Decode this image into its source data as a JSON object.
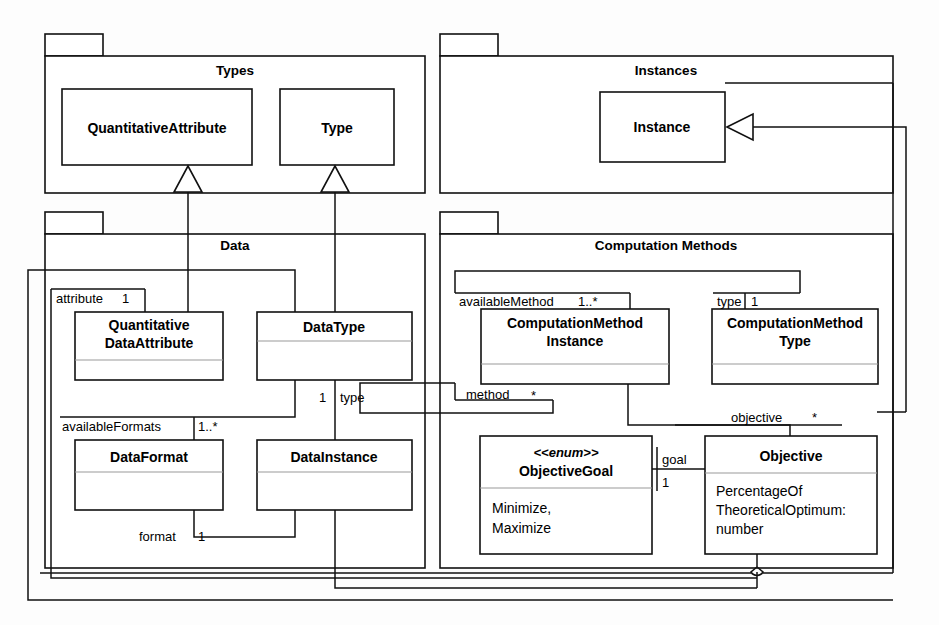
{
  "diagram": {
    "kind": "uml-class-diagram",
    "title": "",
    "line_color": "#111111",
    "fill_color": "#ffffff",
    "divider_color": "#9a9a9a"
  },
  "packages": [
    {
      "id": "types",
      "name": "Types"
    },
    {
      "id": "instances",
      "name": "Instances"
    },
    {
      "id": "data",
      "name": "Data"
    },
    {
      "id": "methods",
      "name": "Computation Methods"
    }
  ],
  "classes": [
    {
      "id": "quantitativeattribute",
      "name_line1": "QuantitativeAttribute",
      "name_line2": "",
      "stereotype": "",
      "compartment": ""
    },
    {
      "id": "type",
      "name_line1": "Type",
      "name_line2": "",
      "stereotype": "",
      "compartment": ""
    },
    {
      "id": "instance",
      "name_line1": "Instance",
      "name_line2": "",
      "stereotype": "",
      "compartment": ""
    },
    {
      "id": "quantitativedataattribute",
      "name_line1": "Quantitative",
      "name_line2": "DataAttribute",
      "stereotype": "",
      "compartment": ""
    },
    {
      "id": "datatype",
      "name_line1": "DataType",
      "name_line2": "",
      "stereotype": "",
      "compartment": ""
    },
    {
      "id": "dataformat",
      "name_line1": "DataFormat",
      "name_line2": "",
      "stereotype": "",
      "compartment": ""
    },
    {
      "id": "datainstance",
      "name_line1": "DataInstance",
      "name_line2": "",
      "stereotype": "",
      "compartment": ""
    },
    {
      "id": "computationmethodinstance",
      "name_line1": "ComputationMethod",
      "name_line2": "Instance",
      "stereotype": "",
      "compartment": ""
    },
    {
      "id": "computationmethodtype",
      "name_line1": "ComputationMethod",
      "name_line2": "Type",
      "stereotype": "",
      "compartment": ""
    },
    {
      "id": "objectivegoal",
      "name_line1": "ObjectiveGoal",
      "name_line2": "",
      "stereotype": "<<enum>>",
      "compartment": ""
    },
    {
      "id": "objective",
      "name_line1": "Objective",
      "name_line2": "",
      "stereotype": "",
      "compartment": ""
    }
  ],
  "class_attributes": {
    "objective": [
      "PercentageOf",
      "TheoreticalOptimum:",
      "number"
    ],
    "objectivegoal": [
      "Minimize,",
      "Maximize"
    ]
  },
  "association_labels": [
    {
      "id": "attribute-role",
      "role": "attribute",
      "multiplicity": "1"
    },
    {
      "id": "availableformats-role",
      "role": "availableFormats",
      "multiplicity": "1..*"
    },
    {
      "id": "format-role",
      "role": "format",
      "multiplicity": "1"
    },
    {
      "id": "type-role-data",
      "role": "type",
      "multiplicity": "1"
    },
    {
      "id": "availablemethod-role",
      "role": "availableMethod",
      "multiplicity": "1..*"
    },
    {
      "id": "type-role-methods",
      "role": "type",
      "multiplicity": "1"
    },
    {
      "id": "method-role",
      "role": "method",
      "multiplicity": "*"
    },
    {
      "id": "objective-role",
      "role": "objective",
      "multiplicity": "*"
    },
    {
      "id": "goal-role",
      "role": "goal",
      "multiplicity": "1"
    }
  ]
}
